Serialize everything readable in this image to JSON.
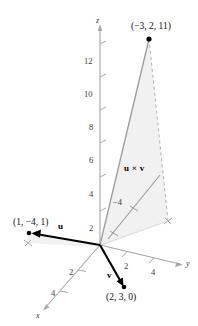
{
  "figure": {
    "type": "3d-vector-diagram",
    "background_color": "#ffffff",
    "fill_color": "#f1f1f1",
    "axis_color": "#9a9a9a",
    "vector_color": "#000000",
    "cross_color": "#8c8c8c"
  },
  "axes": {
    "z": {
      "label": "z",
      "ticks": [
        2,
        4,
        6,
        8,
        10,
        12
      ],
      "tick_labels": [
        "2",
        "4",
        "6",
        "8",
        "10",
        "12"
      ]
    },
    "y": {
      "label": "y",
      "ticks": [
        2,
        4
      ],
      "tick_labels": [
        "2",
        "4"
      ]
    },
    "x": {
      "label": "x",
      "ticks": [
        2,
        4
      ],
      "tick_labels": [
        "2",
        "4"
      ]
    },
    "extra_tick": {
      "label": "-4",
      "text": "−4"
    }
  },
  "points": [
    {
      "name": "cross-product-point",
      "label": "(−3, 2, 11)",
      "coords": [
        -3,
        2,
        11
      ]
    },
    {
      "name": "u-point",
      "label": "(1, −4, 1)",
      "coords": [
        1,
        -4,
        1
      ]
    },
    {
      "name": "v-point",
      "label": "(2, 3, 0)",
      "coords": [
        2,
        3,
        0
      ]
    }
  ],
  "vectors": [
    {
      "name": "u",
      "label": "u"
    },
    {
      "name": "v",
      "label": "v"
    },
    {
      "name": "u-cross-v",
      "label": "u × v"
    }
  ],
  "tick_text": {
    "z12": "12",
    "z10": "10",
    "z8": "8",
    "z6": "6",
    "z4": "4",
    "z2": "2",
    "y2": "2",
    "y4": "4",
    "x2": "2",
    "x4": "4",
    "neg4": "−4"
  },
  "axis_text": {
    "z": "z",
    "y": "y",
    "x": "x"
  }
}
